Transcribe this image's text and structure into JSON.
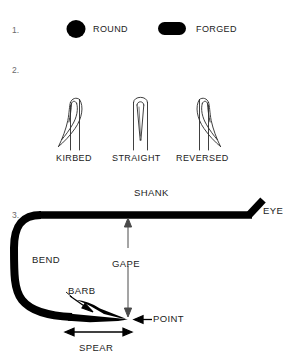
{
  "figure": {
    "background_color": "#ffffff",
    "ink_color": "#000000",
    "text_color": "#1c1c1c",
    "number_color": "#6a6a6a",
    "width": 293,
    "height": 361
  },
  "sections": {
    "one": {
      "number": "1.",
      "items": [
        {
          "label": "ROUND",
          "icon": "round-wire-cross-section-icon"
        },
        {
          "label": "FORGED",
          "icon": "forged-wire-cross-section-icon"
        }
      ]
    },
    "two": {
      "number": "2.",
      "items": [
        {
          "label": "KIRBED",
          "icon": "kirbed-hook-point-icon"
        },
        {
          "label": "STRAIGHT",
          "icon": "straight-hook-point-icon"
        },
        {
          "label": "REVERSED",
          "icon": "reversed-hook-point-icon"
        }
      ]
    },
    "three": {
      "number": "3.",
      "parts": [
        {
          "key": "shank",
          "label": "SHANK"
        },
        {
          "key": "eye",
          "label": "EYE"
        },
        {
          "key": "bend",
          "label": "BEND"
        },
        {
          "key": "barb",
          "label": "BARB"
        },
        {
          "key": "point",
          "label": "POINT"
        },
        {
          "key": "gape",
          "label": "GAPE"
        },
        {
          "key": "spear",
          "label": "SPEAR"
        }
      ]
    }
  }
}
